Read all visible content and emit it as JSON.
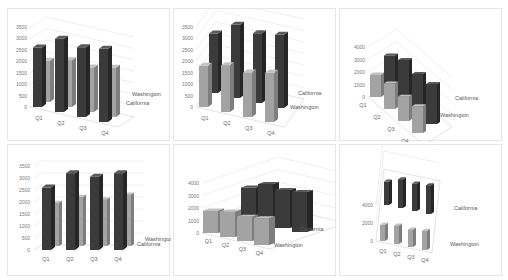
{
  "colors": {
    "california_front": "#3b3b3b",
    "california_side": "#262626",
    "california_top": "#5a5a5a",
    "washington_front": "#a3a3a3",
    "washington_side": "#7e7e7e",
    "washington_top": "#c2c2c2"
  },
  "chart_data": [
    {
      "type": "bar",
      "variant": "3d-column",
      "title": "",
      "categories": [
        "Q1",
        "Q2",
        "Q3",
        "Q4"
      ],
      "series": [
        {
          "name": "California",
          "values": [
            2600,
            3200,
            3050,
            3200
          ]
        },
        {
          "name": "Washington",
          "values": [
            1800,
            2050,
            1950,
            2150
          ]
        }
      ],
      "yticks": [
        "0",
        "500",
        "1000",
        "1500",
        "2000",
        "2500",
        "3000",
        "3500"
      ],
      "ylim": [
        0,
        3500
      ],
      "depth_labels": [
        "Washington",
        "California"
      ],
      "grid": true,
      "legend": "none"
    },
    {
      "type": "bar",
      "variant": "3d-column",
      "title": "",
      "categories": [
        "Q1",
        "Q2",
        "Q3",
        "Q4"
      ],
      "series": [
        {
          "name": "California",
          "values": [
            2600,
            3200,
            3050,
            3200
          ]
        },
        {
          "name": "Washington",
          "values": [
            1800,
            2050,
            1950,
            2150
          ]
        }
      ],
      "yticks": [
        "0",
        "500",
        "1000",
        "1500",
        "2000",
        "2500",
        "3000",
        "3500"
      ],
      "ylim": [
        0,
        3500
      ],
      "depth_labels": [
        "California",
        "Washington"
      ],
      "grid": true,
      "legend": "none"
    },
    {
      "type": "bar",
      "variant": "3d-column-rotated",
      "title": "",
      "categories": [
        "Q1",
        "Q2",
        "Q3",
        "Q4"
      ],
      "series": [
        {
          "name": "California",
          "values": [
            2600,
            3200,
            3050,
            3200
          ]
        },
        {
          "name": "Washington",
          "values": [
            1800,
            2050,
            1950,
            2150
          ]
        }
      ],
      "yticks": [
        "0",
        "1000",
        "2000",
        "3000",
        "4000"
      ],
      "ylim": [
        0,
        4000
      ],
      "depth_labels": [
        "California",
        "Washington"
      ],
      "grid": true,
      "legend": "none"
    },
    {
      "type": "bar",
      "variant": "3d-clustered-column",
      "title": "",
      "categories": [
        "Q1",
        "Q2",
        "Q3",
        "Q4"
      ],
      "series": [
        {
          "name": "California",
          "values": [
            2600,
            3200,
            3050,
            3200
          ]
        },
        {
          "name": "Washington",
          "values": [
            1800,
            2050,
            1950,
            2150
          ]
        }
      ],
      "yticks": [
        "0",
        "500",
        "1000",
        "1500",
        "2000",
        "2500",
        "3000",
        "3500"
      ],
      "ylim": [
        0,
        3500
      ],
      "depth_labels": [
        "Washington",
        "California"
      ],
      "grid": true,
      "legend": "none"
    },
    {
      "type": "bar",
      "variant": "3d-column-low-angle",
      "title": "",
      "categories": [
        "Q1",
        "Q2",
        "Q3",
        "Q4"
      ],
      "series": [
        {
          "name": "California",
          "values": [
            2600,
            3200,
            3050,
            3200
          ]
        },
        {
          "name": "Washington",
          "values": [
            1800,
            2050,
            1950,
            2150
          ]
        }
      ],
      "yticks": [
        "0",
        "1000",
        "2000",
        "3000",
        "4000"
      ],
      "ylim": [
        0,
        4000
      ],
      "depth_labels": [
        "California",
        "Washington"
      ],
      "grid": true,
      "legend": "none"
    },
    {
      "type": "bar",
      "variant": "3d-column-high-angle",
      "title": "",
      "categories": [
        "Q1",
        "Q2",
        "Q3",
        "Q4"
      ],
      "series": [
        {
          "name": "California",
          "values": [
            2600,
            3200,
            3050,
            3200
          ]
        },
        {
          "name": "Washington",
          "values": [
            1800,
            2050,
            1950,
            2150
          ]
        }
      ],
      "yticks": [
        "0",
        "2000",
        "4000"
      ],
      "ylim": [
        0,
        4000
      ],
      "depth_labels": [
        "California",
        "Washington"
      ],
      "grid": true,
      "legend": "none"
    }
  ]
}
